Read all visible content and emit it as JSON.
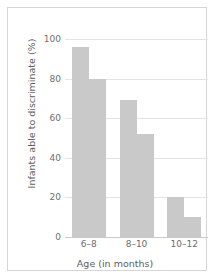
{
  "chart_data": {
    "type": "bar",
    "title": "",
    "xlabel": "Age (in months)",
    "ylabel": "Infants able to discriminate (%)",
    "categories": [
      "6–8",
      "8–10",
      "10–12"
    ],
    "series": [
      {
        "name": "series-1",
        "values": [
          96,
          69,
          20
        ]
      },
      {
        "name": "series-2",
        "values": [
          80,
          52,
          10
        ]
      }
    ],
    "ylim": [
      0,
      100
    ],
    "yticks": [
      0,
      20,
      40,
      60,
      80,
      100
    ],
    "ytick_labels": [
      "0",
      "20",
      "40",
      "60",
      "80",
      "100"
    ],
    "grid": true,
    "legend": "none",
    "bar_color": "#c9c9c9",
    "grid_color": "#e3e3e3",
    "axis_text_color": "#6e6e6e",
    "frame_color": "#d6d6d6",
    "background": "#ffffff"
  }
}
